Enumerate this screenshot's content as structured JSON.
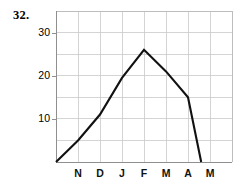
{
  "problem": {
    "number": "32."
  },
  "chart_data": {
    "type": "line",
    "title": "",
    "subtitle": "",
    "xlabel": "",
    "ylabel": "",
    "grid": true,
    "legend": false,
    "legend_position": "none",
    "line_color": "#111111",
    "grid_color": "#c9c9c9",
    "categories": [
      "O",
      "N",
      "D",
      "J",
      "F",
      "M",
      "A",
      "M"
    ],
    "xticklabels": [
      "N",
      "D",
      "J",
      "F",
      "M",
      "A",
      "M"
    ],
    "yticklabels": [
      "10",
      "20",
      "30"
    ],
    "yticks": [
      10,
      20,
      30
    ],
    "ylim": [
      0,
      35
    ],
    "xlim": [
      0,
      8
    ],
    "x": [
      0,
      1,
      2,
      3,
      4,
      5,
      6,
      6.6
    ],
    "values": [
      0,
      5,
      11,
      19.5,
      26,
      21,
      15,
      0
    ],
    "series": [
      {
        "name": "value",
        "values": [
          0,
          5,
          11,
          19.5,
          26,
          21,
          15,
          0
        ]
      }
    ],
    "points": [
      {
        "x": 0,
        "y": 0,
        "label": ""
      },
      {
        "x": 1,
        "y": 5,
        "label": "N"
      },
      {
        "x": 2,
        "y": 11,
        "label": "D"
      },
      {
        "x": 3,
        "y": 19.5,
        "label": "J"
      },
      {
        "x": 4,
        "y": 26,
        "label": "F"
      },
      {
        "x": 5,
        "y": 21,
        "label": "M"
      },
      {
        "x": 6,
        "y": 15,
        "label": "A"
      },
      {
        "x": 6.6,
        "y": 0,
        "label": ""
      }
    ],
    "annotations": []
  }
}
